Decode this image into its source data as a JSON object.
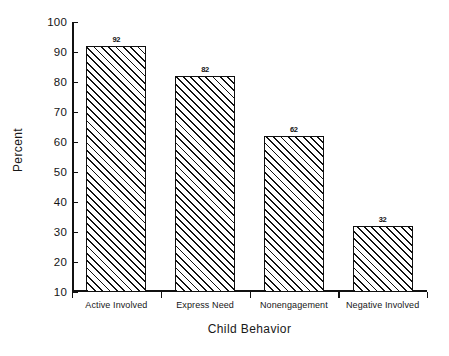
{
  "chart_data": {
    "type": "bar",
    "title": "",
    "xlabel": "Child Behavior",
    "ylabel": "Percent",
    "categories": [
      "Active Involved",
      "Express Need",
      "Nonengagement",
      "Negative Involved"
    ],
    "values": [
      92,
      82,
      62,
      32
    ],
    "value_labels": [
      "92",
      "82",
      "62",
      "32"
    ],
    "ylim": [
      10,
      100
    ],
    "yticks": [
      10,
      20,
      30,
      40,
      50,
      60,
      70,
      80,
      90,
      100
    ],
    "ytick_labels": [
      "10",
      "20",
      "30",
      "40",
      "50",
      "60",
      "70",
      "80",
      "90",
      "100"
    ],
    "grid": false,
    "legend": false,
    "legend_position": "none",
    "bar_fill": "diagonal-hatch",
    "bar_edge_color": "#101010",
    "bar_face_color": "#ffffff",
    "background_color": "#ffffff"
  }
}
